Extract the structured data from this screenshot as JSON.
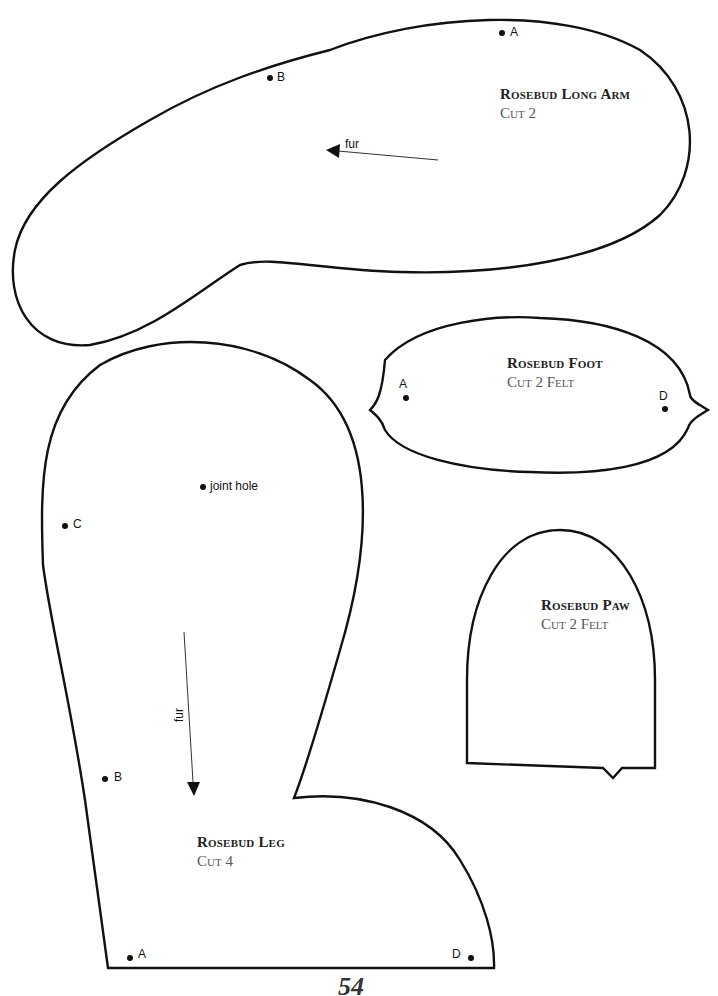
{
  "pieces": {
    "long_arm": {
      "title": "Rosebud Long Arm",
      "cut": "Cut 2",
      "points": [
        "A",
        "B"
      ],
      "arrow_label": "fur"
    },
    "foot": {
      "title": "Rosebud Foot",
      "cut": "Cut 2 Felt",
      "points": [
        "A",
        "D"
      ]
    },
    "paw": {
      "title": "Rosebud Paw",
      "cut": "Cut 2 Felt"
    },
    "leg": {
      "title": "Rosebud Leg",
      "cut": "Cut 4",
      "points": [
        "C",
        "B",
        "A",
        "D"
      ],
      "joint_label": "joint hole",
      "arrow_label": "fur"
    }
  },
  "page_number": "54"
}
